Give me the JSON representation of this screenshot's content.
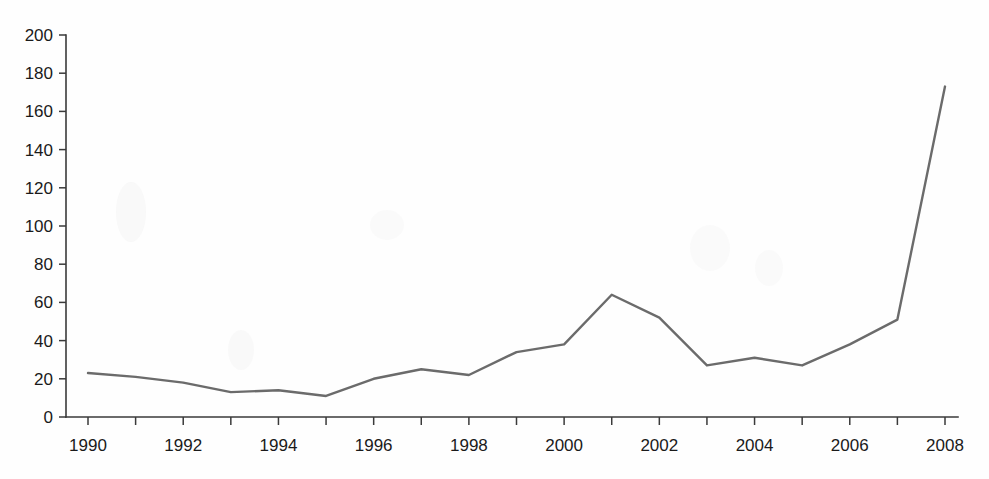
{
  "chart_data": {
    "type": "line",
    "title": "",
    "subtitle": "",
    "xlabel": "",
    "ylabel": "",
    "x": [
      1990,
      1991,
      1992,
      1993,
      1994,
      1995,
      1996,
      1997,
      1998,
      1999,
      2000,
      2001,
      2002,
      2003,
      2004,
      2005,
      2006,
      2007,
      2008
    ],
    "values": [
      23,
      21,
      18,
      13,
      14,
      11,
      20,
      25,
      22,
      34,
      38,
      64,
      52,
      27,
      31,
      27,
      38,
      51,
      173
    ],
    "series": [
      {
        "name": "series-1",
        "values": [
          23,
          21,
          18,
          13,
          14,
          11,
          20,
          25,
          22,
          34,
          38,
          64,
          52,
          27,
          31,
          27,
          38,
          51,
          173
        ]
      }
    ],
    "xlim": [
      1990,
      2008
    ],
    "ylim": [
      0,
      200
    ],
    "y_ticks": [
      0,
      20,
      40,
      60,
      80,
      100,
      120,
      140,
      160,
      180,
      200
    ],
    "y_tick_labels": [
      "0",
      "20",
      "40",
      "60",
      "80",
      "100",
      "120",
      "140",
      "160",
      "180",
      "200"
    ],
    "x_ticks": [
      1990,
      1991,
      1992,
      1993,
      1994,
      1995,
      1996,
      1997,
      1998,
      1999,
      2000,
      2001,
      2002,
      2003,
      2004,
      2005,
      2006,
      2007,
      2008
    ],
    "x_tick_labels": [
      "1990",
      "",
      "1992",
      "",
      "1994",
      "",
      "1996",
      "",
      "1998",
      "",
      "2000",
      "",
      "2002",
      "",
      "2004",
      "",
      "2006",
      "",
      "2008"
    ],
    "grid": false,
    "legend": false,
    "legend_position": "none",
    "line_color": "#6b6b6b",
    "axis_color": "#3a3a3a",
    "background_color": "#ffffff",
    "annotations": []
  }
}
